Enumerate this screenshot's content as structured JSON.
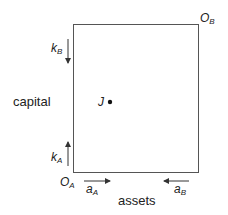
{
  "diagram": {
    "type": "edgeworth-box",
    "axis_labels": {
      "vertical": "capital",
      "horizontal": "assets"
    },
    "origins": {
      "a": {
        "main": "O",
        "sub": "A"
      },
      "b": {
        "main": "O",
        "sub": "B"
      }
    },
    "arrows": {
      "k_b": {
        "main": "k",
        "sub": "B",
        "direction": "down"
      },
      "k_a": {
        "main": "k",
        "sub": "A",
        "direction": "up"
      },
      "a_a": {
        "main": "a",
        "sub": "A",
        "direction": "right"
      },
      "a_b": {
        "main": "a",
        "sub": "B",
        "direction": "left"
      }
    },
    "point": {
      "label": "J"
    },
    "colors": {
      "line": "#555555",
      "text": "#222222"
    }
  }
}
